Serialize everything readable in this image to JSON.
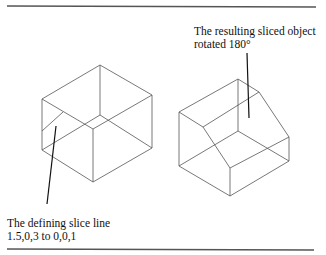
{
  "figure": {
    "annotations": {
      "result_label_line1": "The resulting sliced object",
      "result_label_line2": "rotated 180°",
      "slice_label_line1": "The defining slice line",
      "slice_label_line2": "1.5,0,3 to 0,0,1"
    },
    "colors": {
      "wireframe": "#555555",
      "leader": "#111111",
      "rule": "#444444"
    }
  }
}
